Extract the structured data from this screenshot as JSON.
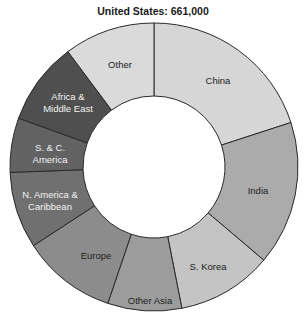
{
  "chart_data": {
    "type": "pie",
    "subtype": "donut",
    "title": "United States: 661,000",
    "total": 661000,
    "start_angle_deg": 0,
    "direction": "clockwise",
    "center": [
      154,
      167
    ],
    "outer_radius": 144,
    "inner_radius": 71,
    "legend": "none (labels inside segments)",
    "segments": [
      {
        "label": [
          "China"
        ],
        "percent": 20.0,
        "value": 132000,
        "color": "#d6d6d6",
        "text_color": "#222222",
        "label_pos": [
          218,
          80
        ]
      },
      {
        "label": [
          "India"
        ],
        "percent": 16.2,
        "value": 107000,
        "color": "#ababab",
        "text_color": "#222222",
        "label_pos": [
          258,
          190
        ]
      },
      {
        "label": [
          "S. Korea"
        ],
        "percent": 10.7,
        "value": 71000,
        "color": "#c4c4c4",
        "text_color": "#222222",
        "label_pos": [
          208,
          266
        ]
      },
      {
        "label": [
          "Other Asia"
        ],
        "percent": 8.3,
        "value": 55000,
        "color": "#9c9c9c",
        "text_color": "#222222",
        "label_pos": [
          150,
          300
        ]
      },
      {
        "label": [
          "Europe"
        ],
        "percent": 10.6,
        "value": 70000,
        "color": "#8c8c8c",
        "text_color": "#222222",
        "label_pos": [
          96,
          255
        ]
      },
      {
        "label": [
          "N. America &",
          "Caribbean"
        ],
        "percent": 8.6,
        "value": 57000,
        "color": "#707070",
        "text_color": "#f2f2f2",
        "label_pos": [
          50,
          200
        ]
      },
      {
        "label": [
          "S. & C.",
          "America"
        ],
        "percent": 6.1,
        "value": 40000,
        "color": "#626262",
        "text_color": "#f2f2f2",
        "label_pos": [
          50,
          153
        ]
      },
      {
        "label": [
          "Africa &",
          "Middle East"
        ],
        "percent": 9.3,
        "value": 61000,
        "color": "#4f4f4f",
        "text_color": "#f2f2f2",
        "label_pos": [
          68,
          102
        ]
      },
      {
        "label": [
          "Other"
        ],
        "percent": 10.2,
        "value": 68000,
        "color": "#dadada",
        "text_color": "#222222",
        "label_pos": [
          120,
          64
        ]
      }
    ]
  }
}
